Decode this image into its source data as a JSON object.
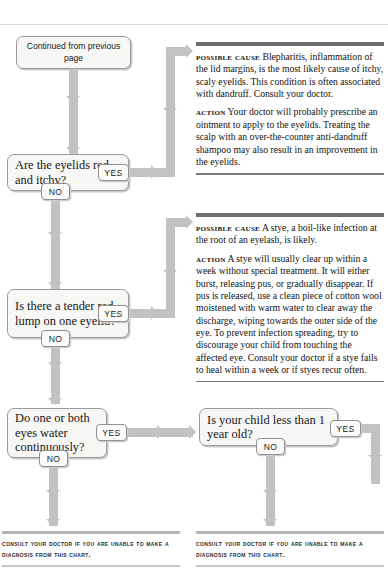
{
  "chart": {
    "start_box": "Continued from previous page",
    "questions": [
      {
        "id": "q1",
        "text": "Are the eyelids red and itchy?",
        "yes": "YES",
        "no": "NO"
      },
      {
        "id": "q2",
        "text": "Is there a tender red lump on one eyelid?",
        "yes": "YES",
        "no": "NO"
      },
      {
        "id": "q3",
        "text": "Do one or both eyes water continuously?",
        "yes": "YES",
        "no": "NO"
      },
      {
        "id": "q4",
        "text": "Is your child less than 1 year old?",
        "yes": "YES",
        "no": "NO"
      }
    ],
    "advice": [
      {
        "id": "advice1",
        "cause_label": "Possible cause",
        "cause_text": "Blepharitis, inflammation of the lid margins, is the most likely cause of itchy, scaly eyelids. This condition is often associated with dandruff. Consult your doctor.",
        "action_label": "Action",
        "action_text": "Your doctor will probably prescribe an ointment to apply to the eyelids. Treating the scalp with an over-the-counter anti-dandruff shampoo may also result in an improvement in the eyelids."
      },
      {
        "id": "advice2",
        "cause_label": "Possible cause",
        "cause_text": "A stye, a boil-like infection at the root of an eyelash, is likely.",
        "action_label": "Action",
        "action_text": "A stye will usually clear up within a week without special treatment. It will either burst, releasing pus, or gradually disappear. If pus is released, use a clean piece of cotton wool moistened with warm water to clear away the discharge, wiping towards the outer side of the eye. To prevent infection spreading, try to discourage your child from touching the affected eye. Consult your doctor if a stye fails to heal within a week or if styes recur often."
      }
    ],
    "footers": [
      {
        "id": "footer-left",
        "text": "Consult your doctor if you are unable to make a diagnosis from this chart."
      },
      {
        "id": "footer-right",
        "text": "Consult your doctor if you are unable to make a diagnosis from this chart."
      }
    ],
    "colors": {
      "connector": "#c2c2c2",
      "box_fill": "#f7f7f5",
      "box_border": "#9a9a9a",
      "rule_dark": "#6e6e6e"
    }
  }
}
